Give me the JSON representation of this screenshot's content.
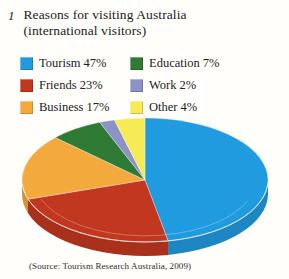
{
  "title": {
    "number": "1",
    "line1": "Reasons for visiting Australia",
    "line2": "(international visitors)"
  },
  "legend": {
    "items": [
      {
        "text": "Tourism 47%",
        "color": "#209BDF"
      },
      {
        "text": "Friends 23%",
        "color": "#C2371F"
      },
      {
        "text": "Business 17%",
        "color": "#F4A93C"
      },
      {
        "text": "Education 7%",
        "color": "#2F7A35"
      },
      {
        "text": "Work 2%",
        "color": "#8A92C6"
      },
      {
        "text": "Other 4%",
        "color": "#F6EB55"
      }
    ]
  },
  "chart_data": {
    "type": "pie",
    "style": "3d",
    "title": "Reasons for visiting Australia (international visitors)",
    "categories": [
      "Tourism",
      "Friends",
      "Business",
      "Education",
      "Work",
      "Other"
    ],
    "values": [
      47,
      23,
      17,
      7,
      2,
      4
    ],
    "unit": "%",
    "colors": [
      "#209BDF",
      "#C2371F",
      "#F4A93C",
      "#2F7A35",
      "#8A92C6",
      "#F6EB55"
    ],
    "start_angle": "top",
    "direction": "clockwise",
    "legend_position": "top"
  },
  "source": "(Source: Tourism Research Australia, 2009)"
}
